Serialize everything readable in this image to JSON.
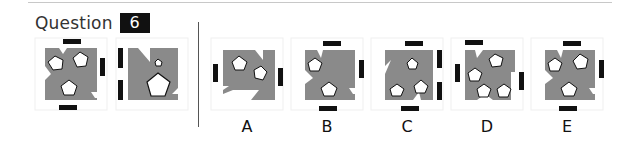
{
  "question": {
    "label": "Question",
    "number": "6"
  },
  "colors": {
    "shape_fill": "#8a8a8a",
    "bar_fill": "#111111",
    "pentagon_fill": "#ffffff",
    "frame_stroke": "#eeeeee",
    "divider": "#555555"
  },
  "sequence": [
    {
      "id": "q1",
      "description": "grey notched square with three white pentagons; bars top, right, bottom"
    },
    {
      "id": "q2",
      "description": "grey notched square with one small and one large pentagon; two bars on left"
    }
  ],
  "options": [
    {
      "id": "A",
      "label": "A"
    },
    {
      "id": "B",
      "label": "B"
    },
    {
      "id": "C",
      "label": "C"
    },
    {
      "id": "D",
      "label": "D"
    },
    {
      "id": "E",
      "label": "E"
    }
  ]
}
